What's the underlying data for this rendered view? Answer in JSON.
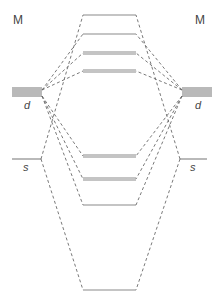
{
  "diagram": {
    "left_atom": {
      "label": "M",
      "d_label": "d",
      "s_label": "s"
    },
    "right_atom": {
      "label": "M",
      "d_label": "d",
      "s_label": "s"
    },
    "colors": {
      "level": "#8a8a8a",
      "connector": "#6a6a6a",
      "text": "#444444"
    },
    "atomic_levels": {
      "d_left": {
        "x1": 12,
        "x2": 42,
        "ys": [
          88,
          90,
          92,
          94,
          96
        ]
      },
      "d_right": {
        "x1": 182,
        "x2": 212,
        "ys": [
          88,
          90,
          92,
          94,
          96
        ]
      },
      "s_left": {
        "x1": 12,
        "x2": 41,
        "y": 159
      },
      "s_right": {
        "x1": 180,
        "x2": 207,
        "y": 159
      }
    },
    "mo_levels": [
      {
        "name": "antibonding-s",
        "y": 15,
        "degeneracy": 1
      },
      {
        "name": "antibonding-d-sigma",
        "y": 34,
        "degeneracy": 1
      },
      {
        "name": "antibonding-d-pi",
        "y": 52,
        "degeneracy": 2
      },
      {
        "name": "antibonding-d-delta",
        "y": 70,
        "degeneracy": 2
      },
      {
        "name": "bonding-d-delta",
        "y": 155,
        "degeneracy": 2
      },
      {
        "name": "bonding-d-pi",
        "y": 178,
        "degeneracy": 2
      },
      {
        "name": "bonding-d-sigma",
        "y": 205,
        "degeneracy": 1
      },
      {
        "name": "bonding-s",
        "y": 290,
        "degeneracy": 1
      }
    ]
  }
}
